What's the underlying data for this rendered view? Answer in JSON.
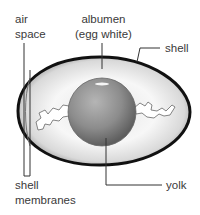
{
  "diagram": {
    "labels": {
      "air_space": [
        "air",
        "space"
      ],
      "albumen": [
        "albumen",
        "(egg white)"
      ],
      "shell": "shell",
      "shell_membranes": [
        "shell",
        "membranes"
      ],
      "yolk": "yolk"
    },
    "colors": {
      "shell_outline": "#111111",
      "albumen": "#f2f2f2",
      "yolk": "#8a8a8a",
      "chalaza": "#ffffff",
      "leader_line": "#333333",
      "text": "#3a3a3a"
    }
  }
}
